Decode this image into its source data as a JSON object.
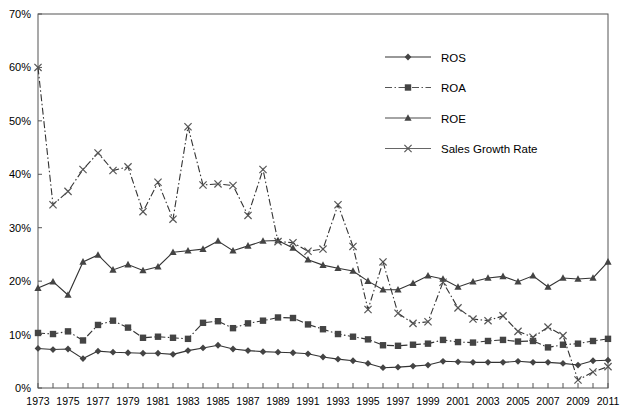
{
  "chart_data": {
    "type": "line",
    "title": "",
    "subtitle": "",
    "xlabel": "",
    "ylabel": "",
    "x": [
      1973,
      1974,
      1975,
      1976,
      1977,
      1978,
      1979,
      1980,
      1981,
      1982,
      1983,
      1984,
      1985,
      1986,
      1987,
      1988,
      1989,
      1990,
      1991,
      1992,
      1993,
      1994,
      1995,
      1996,
      1997,
      1998,
      1999,
      2000,
      2001,
      2002,
      2003,
      2004,
      2005,
      2006,
      2007,
      2008,
      2009,
      2010,
      2011
    ],
    "x_tick_labels": [
      "1973",
      "1975",
      "1977",
      "1979",
      "1981",
      "1983",
      "1985",
      "1987",
      "1989",
      "1991",
      "1993",
      "1995",
      "1997",
      "1999",
      "2001",
      "2003",
      "2005",
      "2007",
      "2009",
      "2011"
    ],
    "y_tick_labels": [
      "0%",
      "10%",
      "20%",
      "30%",
      "40%",
      "50%",
      "60%",
      "70%"
    ],
    "y_ticks": [
      0,
      10,
      20,
      30,
      40,
      50,
      60,
      70
    ],
    "ylim": [
      0,
      70
    ],
    "xlim": [
      1973,
      2011
    ],
    "grid": false,
    "legend_position": "top-right",
    "series": [
      {
        "name": "ROS",
        "marker": "diamond",
        "line_style": "solid",
        "color": "#333333",
        "values": [
          7.4,
          7.2,
          7.3,
          5.5,
          6.9,
          6.7,
          6.6,
          6.5,
          6.5,
          6.3,
          7.0,
          7.5,
          8.0,
          7.3,
          7.0,
          6.8,
          6.7,
          6.6,
          6.4,
          5.8,
          5.4,
          5.1,
          4.6,
          3.8,
          3.9,
          4.1,
          4.3,
          5.0,
          4.9,
          4.8,
          4.8,
          4.8,
          5.0,
          4.8,
          4.8,
          4.6,
          4.3,
          5.1,
          5.2
        ]
      },
      {
        "name": "ROA",
        "marker": "square",
        "line_style": "dash-dot",
        "color": "#555555",
        "values": [
          10.3,
          10.1,
          10.6,
          8.9,
          11.8,
          12.6,
          11.3,
          9.4,
          9.6,
          9.4,
          9.2,
          12.2,
          12.5,
          11.2,
          12.1,
          12.6,
          13.2,
          13.1,
          11.9,
          11.0,
          10.1,
          9.6,
          9.1,
          8.0,
          7.9,
          8.1,
          8.3,
          9.0,
          8.6,
          8.5,
          8.8,
          9.0,
          8.7,
          8.8,
          7.6,
          8.1,
          8.3,
          8.8,
          9.2
        ]
      },
      {
        "name": "ROE",
        "marker": "triangle",
        "line_style": "solid",
        "color": "#4a4a4a",
        "values": [
          18.7,
          19.9,
          17.4,
          23.6,
          24.9,
          22.1,
          23.1,
          22.0,
          22.7,
          25.4,
          25.7,
          26.0,
          27.5,
          25.7,
          26.6,
          27.5,
          27.6,
          26.2,
          24.0,
          23.0,
          22.4,
          21.9,
          20.0,
          18.4,
          18.4,
          19.6,
          21.0,
          20.4,
          18.9,
          19.9,
          20.6,
          20.9,
          19.9,
          21.0,
          18.9,
          20.6,
          20.4,
          20.6,
          23.6
        ]
      },
      {
        "name": "Sales Growth Rate",
        "marker": "x",
        "line_style": "dash-dot",
        "color": "#666666",
        "values": [
          60.0,
          34.3,
          36.8,
          40.9,
          44.0,
          40.7,
          41.4,
          33.0,
          38.5,
          31.6,
          48.9,
          38.0,
          38.2,
          37.9,
          32.3,
          40.9,
          27.4,
          27.2,
          25.6,
          26.0,
          34.3,
          26.5,
          14.7,
          23.6,
          14.0,
          12.1,
          12.4,
          19.8,
          15.0,
          12.9,
          12.6,
          13.5,
          10.6,
          9.5,
          11.4,
          9.8,
          1.5,
          3.0,
          4.0
        ]
      }
    ],
    "legend": [
      {
        "label": "ROS",
        "marker": "diamond",
        "line_style": "solid"
      },
      {
        "label": "ROA",
        "marker": "square",
        "line_style": "dash-dot"
      },
      {
        "label": "ROE",
        "marker": "triangle",
        "line_style": "solid"
      },
      {
        "label": "Sales Growth Rate",
        "marker": "x",
        "line_style": "solid"
      }
    ]
  }
}
